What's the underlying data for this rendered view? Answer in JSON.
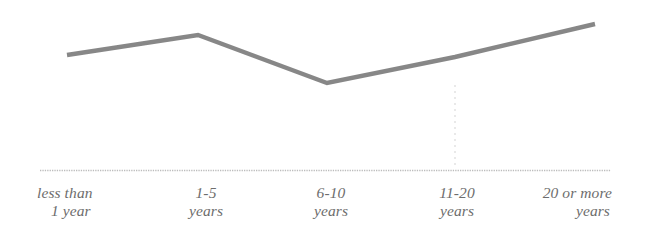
{
  "figure": {
    "background_color": "#ffffff",
    "line_color": "#7d7d7d",
    "axis_color": "#bcbcbc",
    "gridline_color": "#e9e9e9",
    "label_color": "#6d6d6d"
  },
  "chart_data": {
    "type": "line",
    "title": "",
    "subtitle": "",
    "xlabel": "",
    "ylabel": "",
    "categories": [
      "less than 1 year",
      "1-5 years",
      "6-10 years",
      "11-20 years",
      "20 or more years"
    ],
    "tick_labels": [
      {
        "line1": "less than",
        "line2": "1 year"
      },
      {
        "line1": "1-5",
        "line2": "years"
      },
      {
        "line1": "6-10",
        "line2": "years"
      },
      {
        "line1": "11-20",
        "line2": "years"
      },
      {
        "line1": "20 or more",
        "line2": "years"
      }
    ],
    "series": [
      {
        "name": "trend",
        "values": [
          62,
          75,
          42,
          62,
          87
        ]
      }
    ],
    "ylim": [
      0,
      100
    ],
    "grid": false,
    "vertical_gridlines_at": [
      "11-20 years"
    ],
    "legend": "none",
    "legend_position": "none",
    "axis_style": "dotted-baseline",
    "annotations": []
  },
  "geometry": {
    "points": [
      {
        "x": 67,
        "y": 55
      },
      {
        "x": 198,
        "y": 35
      },
      {
        "x": 327,
        "y": 83
      },
      {
        "x": 455,
        "y": 57
      },
      {
        "x": 595,
        "y": 24
      }
    ],
    "baseline": {
      "x1": 40,
      "x2": 611,
      "y": 170
    },
    "vertical_gridline": {
      "x": 455,
      "y1": 85,
      "y2": 169
    }
  }
}
